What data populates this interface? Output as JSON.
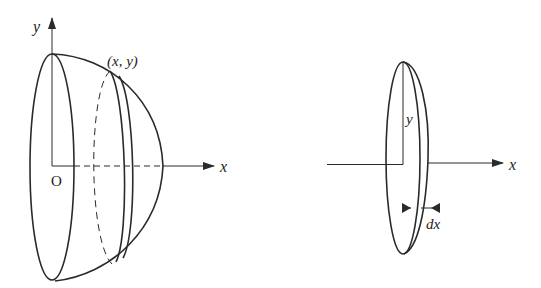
{
  "figure": {
    "left_panel": {
      "description": "Solid of revolution (hemispherical dome) about the x-axis",
      "labels": {
        "y_axis": "y",
        "x_axis": "x",
        "origin": "O",
        "point": "(x, y)"
      }
    },
    "right_panel": {
      "description": "Thin disk slice of radius y and thickness dx",
      "labels": {
        "radius": "y",
        "x_axis": "x",
        "thickness": "dx"
      }
    },
    "colors": {
      "stroke": "#2a2a2a",
      "background": "#ffffff"
    }
  }
}
